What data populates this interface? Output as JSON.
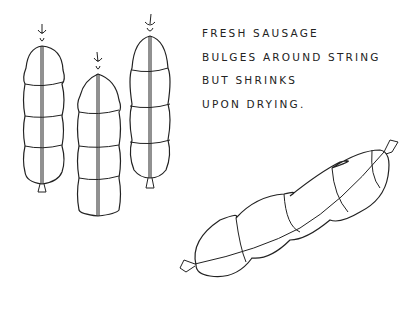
{
  "illustration": {
    "subject": "hanging sausages and dried sausage line drawing",
    "caption_lines": [
      "FRESH SAUSAGE",
      "BULGES AROUND STRING",
      "BUT SHRINKS",
      "UPON DRYING."
    ],
    "ink_color": "#222222",
    "background_color": "#ffffff"
  }
}
